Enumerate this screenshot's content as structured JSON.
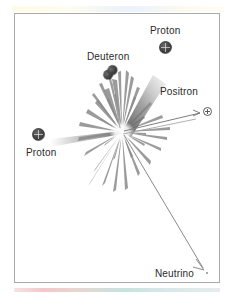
{
  "figure": {
    "background_color": "#ffffff",
    "border_color": "#a9a9ab",
    "ink_color": "#2b2b2b",
    "burst_color": "#8d8d8d"
  },
  "labels": {
    "proton_top": "Proton",
    "deuteron": "Deuteron",
    "positron": "Positron",
    "proton_left": "Proton",
    "neutrino": "Neutrino"
  },
  "particles": [
    {
      "name": "proton-top",
      "label": "Proton",
      "icon": "proton-sphere-icon",
      "x": 165,
      "y": 47
    },
    {
      "name": "deuteron",
      "label": "Deuteron",
      "icon": "deuteron-double-lobe-icon",
      "x": 111,
      "y": 74
    },
    {
      "name": "positron",
      "label": "Positron",
      "icon": "circled-plus-icon",
      "x": 208,
      "y": 112
    },
    {
      "name": "proton-left",
      "label": "Proton",
      "icon": "proton-sphere-icon",
      "x": 38,
      "y": 135
    },
    {
      "name": "neutrino",
      "label": "Neutrino",
      "icon": "neutrino-dot-icon",
      "x": 207,
      "y": 273
    }
  ],
  "collision": {
    "center_x": 122,
    "center_y": 132,
    "description": "starburst of radiating rays"
  },
  "rays": [
    {
      "name": "incoming-proton-beam",
      "from": [
        52,
        142
      ],
      "to": [
        122,
        132
      ]
    },
    {
      "name": "deuteron-ray",
      "from": [
        122,
        132
      ],
      "to": [
        110,
        80
      ]
    },
    {
      "name": "positron-ray",
      "from": [
        122,
        132
      ],
      "to": [
        201,
        113
      ]
    },
    {
      "name": "proton-ray",
      "from": [
        122,
        132
      ],
      "to": [
        160,
        58
      ]
    },
    {
      "name": "neutrino-ray",
      "from": [
        122,
        132
      ],
      "to": [
        205,
        272
      ]
    }
  ]
}
